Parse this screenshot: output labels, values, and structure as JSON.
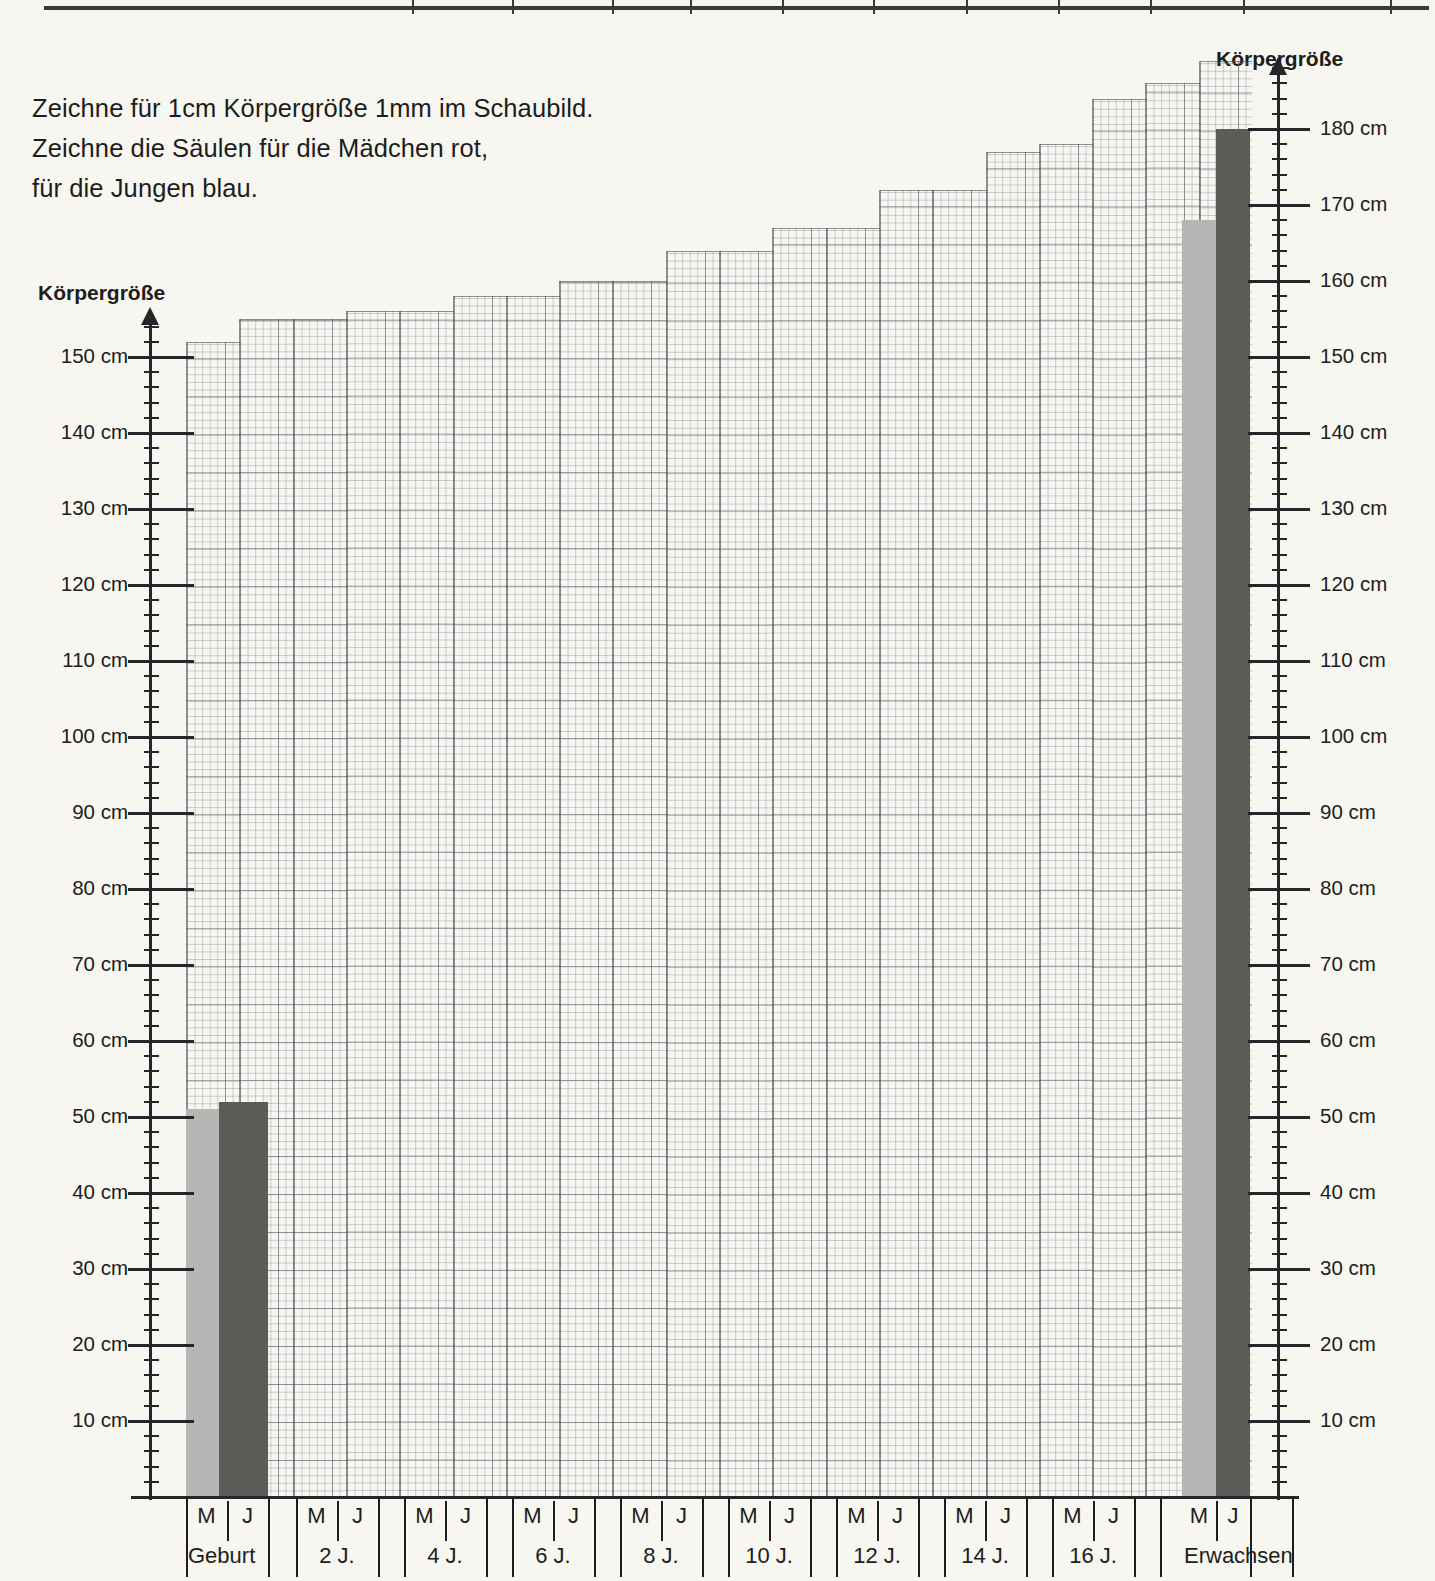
{
  "instructions": [
    "Zeichne für 1cm Körpergröße 1mm im Schaubild.",
    "Zeichne die Säulen für die Mädchen rot,",
    "für die Jungen blau."
  ],
  "axis_title_left": "Körpergröße",
  "axis_title_right": "Körpergröße",
  "colors": {
    "girls_bar": "#b5b5b3",
    "boys_bar": "#5d5b57",
    "axis": "#26262a",
    "grid": "#5a6068",
    "paper": "#f7f6f1"
  },
  "legend": {
    "girls_code": "M",
    "boys_code": "J"
  },
  "chart_data": {
    "type": "bar",
    "title": "Körpergröße",
    "xlabel": "",
    "ylabel": "Körpergröße",
    "ylim": [
      0,
      190
    ],
    "yticks": [
      10,
      20,
      30,
      40,
      50,
      60,
      70,
      80,
      90,
      100,
      110,
      120,
      130,
      140,
      150
    ],
    "yticks_right": [
      10,
      20,
      30,
      40,
      50,
      60,
      70,
      80,
      90,
      100,
      110,
      120,
      130,
      140,
      150,
      160,
      170,
      180
    ],
    "ytick_labels": [
      "10 cm",
      "20 cm",
      "30 cm",
      "40 cm",
      "50 cm",
      "60 cm",
      "70 cm",
      "80 cm",
      "90 cm",
      "100 cm",
      "110 cm",
      "120 cm",
      "130 cm",
      "140 cm",
      "150 cm"
    ],
    "ytick_labels_right": [
      "10 cm",
      "20 cm",
      "30 cm",
      "40 cm",
      "50 cm",
      "60 cm",
      "70 cm",
      "80 cm",
      "90 cm",
      "100 cm",
      "110 cm",
      "120 cm",
      "130 cm",
      "140 cm",
      "150 cm",
      "160 cm",
      "170 cm",
      "180 cm"
    ],
    "unit": "cm",
    "tick_interval_minor": 2,
    "tick_interval_medium": 5,
    "tick_interval_major": 10,
    "grid": true,
    "legend_position": "none",
    "categories": [
      "Geburt",
      "2 J.",
      "4 J.",
      "6 J.",
      "8 J.",
      "10 J.",
      "12 J.",
      "14 J.",
      "16 J.",
      "Erwachsen"
    ],
    "series": [
      {
        "name": "M",
        "values": [
          51,
          null,
          null,
          null,
          null,
          null,
          null,
          null,
          null,
          168
        ]
      },
      {
        "name": "J",
        "values": [
          52,
          null,
          null,
          null,
          null,
          null,
          null,
          null,
          null,
          180
        ]
      }
    ],
    "grid_top_heights_cm": [
      152,
      155,
      155,
      156,
      156,
      158,
      158,
      160,
      160,
      164,
      164,
      167,
      167,
      172,
      172,
      177,
      178,
      184,
      186,
      189
    ]
  }
}
